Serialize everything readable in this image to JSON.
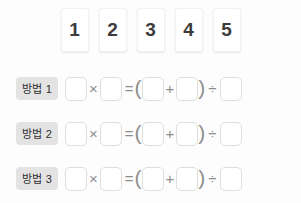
{
  "tray": {
    "name": "number-card-tray",
    "cards": [
      {
        "value": "1"
      },
      {
        "value": "2"
      },
      {
        "value": "3"
      },
      {
        "value": "4"
      },
      {
        "value": "5"
      }
    ]
  },
  "operators": {
    "multiply": "×",
    "equals": "=",
    "paren_open": "(",
    "plus": "+",
    "paren_close": ")",
    "divide": "÷"
  },
  "rows": [
    {
      "label": "방법 1",
      "slots": [
        "",
        "",
        "",
        "",
        ""
      ]
    },
    {
      "label": "방법 2",
      "slots": [
        "",
        "",
        "",
        "",
        ""
      ]
    },
    {
      "label": "방법 3",
      "slots": [
        "",
        "",
        "",
        "",
        ""
      ]
    }
  ],
  "colors": {
    "background": "#fdfdfd",
    "card_bg": "#ffffff",
    "card_text": "#3c3c3c",
    "label_bg": "#e3e3e3",
    "label_text": "#2f2f2f",
    "slot_border": "#dedede",
    "operator": "#8e8e8e"
  }
}
